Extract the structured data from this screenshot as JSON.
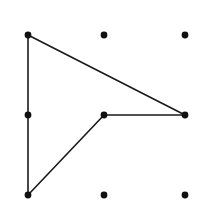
{
  "figure": {
    "width": 205,
    "height": 217,
    "background_color": "#ffffff",
    "stroke_color": "#1a1a1a",
    "dot_color": "#111111",
    "stroke_width": 1.6,
    "dot_radius": 3.4,
    "grid": {
      "columns": 3,
      "rows": 3,
      "x_positions": [
        28,
        104,
        185
      ],
      "y_positions": [
        35,
        115,
        195
      ]
    },
    "dots": [
      {
        "name": "dot-top-left",
        "x": 28,
        "y": 35
      },
      {
        "name": "dot-top-center",
        "x": 104,
        "y": 35
      },
      {
        "name": "dot-top-right",
        "x": 185,
        "y": 35
      },
      {
        "name": "dot-middle-left",
        "x": 28,
        "y": 115
      },
      {
        "name": "dot-middle-center",
        "x": 104,
        "y": 115
      },
      {
        "name": "dot-middle-right",
        "x": 185,
        "y": 115
      },
      {
        "name": "dot-bottom-left",
        "x": 28,
        "y": 195
      },
      {
        "name": "dot-bottom-center",
        "x": 104,
        "y": 195
      },
      {
        "name": "dot-bottom-right",
        "x": 185,
        "y": 195
      }
    ],
    "segments": [
      {
        "name": "segment-left-vertical",
        "from": "dot-top-left",
        "to": "dot-bottom-left",
        "x1": 28,
        "y1": 35,
        "x2": 28,
        "y2": 195
      },
      {
        "name": "segment-upper-diagonal",
        "from": "dot-top-left",
        "to": "dot-middle-right",
        "x1": 28,
        "y1": 35,
        "x2": 185,
        "y2": 115
      },
      {
        "name": "segment-horizontal",
        "from": "dot-middle-center",
        "to": "dot-middle-right",
        "x1": 104,
        "y1": 115,
        "x2": 185,
        "y2": 115
      },
      {
        "name": "segment-lower-diagonal",
        "from": "dot-bottom-left",
        "to": "dot-middle-center",
        "x1": 28,
        "y1": 195,
        "x2": 104,
        "y2": 115
      }
    ]
  }
}
